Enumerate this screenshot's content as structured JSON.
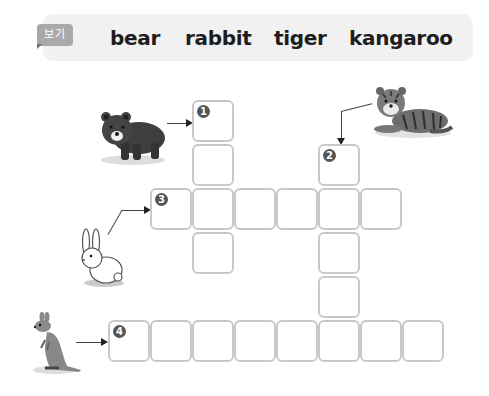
{
  "word_bank": {
    "tag_label": "보기",
    "words": [
      "bear",
      "rabbit",
      "tiger",
      "kangaroo"
    ]
  },
  "clues": [
    {
      "number": "1",
      "animal": "bear",
      "direction": "down",
      "length": 4
    },
    {
      "number": "2",
      "animal": "tiger",
      "direction": "down",
      "length": 5
    },
    {
      "number": "3",
      "animal": "rabbit",
      "direction": "across",
      "length": 6
    },
    {
      "number": "4",
      "animal": "kangaroo",
      "direction": "across",
      "length": 8
    }
  ],
  "colors": {
    "banner_bg": "#f1f1f1",
    "tag_bg": "#a9a9a9",
    "cell_border": "#c9c9c9",
    "number_badge": "#555555"
  }
}
